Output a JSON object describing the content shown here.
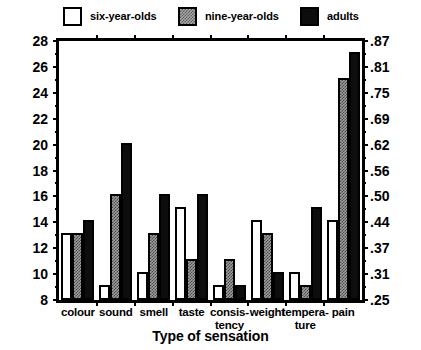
{
  "chart_data": {
    "type": "bar",
    "title": "",
    "xlabel": "Type of sensation",
    "ylabel": "",
    "categories": [
      "colour",
      "sound",
      "smell",
      "taste",
      "consis-\ntency",
      "weight",
      "tempera-\nture",
      "pain"
    ],
    "category_lines": [
      [
        "colour"
      ],
      [
        "sound"
      ],
      [
        "smell"
      ],
      [
        "taste"
      ],
      [
        "consis-",
        "tency"
      ],
      [
        "weight"
      ],
      [
        "tempera-",
        "ture"
      ],
      [
        "pain"
      ]
    ],
    "series": [
      {
        "name": "six-year-olds",
        "key": "six",
        "color": "#ffffff",
        "values": [
          13,
          9,
          10,
          15,
          9,
          14,
          10,
          14
        ]
      },
      {
        "name": "nine-year-olds",
        "key": "nine",
        "color": "#9d9d9d",
        "values": [
          13,
          16,
          13,
          11,
          11,
          13,
          9,
          25
        ]
      },
      {
        "name": "adults",
        "key": "adults",
        "color": "#0d0d0d",
        "values": [
          14,
          20,
          16,
          16,
          9,
          10,
          15,
          27
        ]
      }
    ],
    "ylim": [
      8,
      28
    ],
    "ytick_values": [
      8,
      10,
      12,
      14,
      16,
      18,
      20,
      22,
      24,
      26,
      28
    ],
    "ytick_labels": [
      "8",
      "10",
      "12",
      "14",
      "16",
      "18",
      "20",
      "22",
      "24",
      "26",
      "28"
    ],
    "ytick_minor_values": [
      9,
      11,
      13,
      15,
      17,
      19,
      21,
      23,
      25,
      27
    ],
    "ylim_right": [
      0.25,
      0.87
    ],
    "ytick_right_values": [
      0.25,
      0.31,
      0.37,
      0.44,
      0.5,
      0.56,
      0.62,
      0.69,
      0.75,
      0.81,
      0.87
    ],
    "ytick_right_labels": [
      ".25",
      ".31",
      ".37",
      ".44",
      ".50",
      ".56",
      ".62",
      ".69",
      ".75",
      ".81",
      ".87"
    ],
    "grid": false,
    "legend_position": "top"
  },
  "legend": {
    "entries": [
      {
        "label": "six-year-olds",
        "swatch": "six"
      },
      {
        "label": "nine-year-olds",
        "swatch": "nine"
      },
      {
        "label": "adults",
        "swatch": "adults"
      }
    ]
  },
  "axes": {
    "x_title": "Type of sensation"
  }
}
